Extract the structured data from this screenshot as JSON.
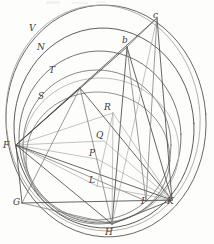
{
  "figure": {
    "width": 214,
    "height": 244,
    "background_color": "#fdfdfb",
    "ink_colors": {
      "dark": "#4a4a4a",
      "medium": "#6e6e6e",
      "light": "#9a9a9a",
      "faint": "#c2c2c2",
      "sepia": "#a9a195"
    },
    "labels": [
      {
        "id": "V",
        "text": "V",
        "x": 29,
        "y": 24
      },
      {
        "id": "N",
        "text": "N",
        "x": 37,
        "y": 43
      },
      {
        "id": "T",
        "text": "T",
        "x": 49,
        "y": 66
      },
      {
        "id": "S",
        "text": "S",
        "x": 38,
        "y": 92
      },
      {
        "id": "c",
        "text": "c",
        "x": 153,
        "y": 11
      },
      {
        "id": "b",
        "text": "b",
        "x": 122,
        "y": 36
      },
      {
        "id": "R",
        "text": "R",
        "x": 104,
        "y": 103
      },
      {
        "id": "Q",
        "text": "Q",
        "x": 96,
        "y": 131
      },
      {
        "id": "P",
        "text": "P",
        "x": 89,
        "y": 149
      },
      {
        "id": "L",
        "text": "L",
        "x": 89,
        "y": 176
      },
      {
        "id": "F",
        "text": "F",
        "x": 3,
        "y": 141
      },
      {
        "id": "G",
        "text": "G",
        "x": 13,
        "y": 198
      },
      {
        "id": "H",
        "text": "H",
        "x": 105,
        "y": 228
      },
      {
        "id": "I",
        "text": "I",
        "x": 141,
        "y": 197
      },
      {
        "id": "K",
        "text": "K",
        "x": 167,
        "y": 197
      }
    ],
    "vertices": [
      {
        "id": "c",
        "x": 157,
        "y": 18
      },
      {
        "id": "b",
        "x": 127,
        "y": 47
      },
      {
        "id": "A",
        "x": 80,
        "y": 88
      },
      {
        "id": "R",
        "x": 113,
        "y": 113
      },
      {
        "id": "Q",
        "x": 104,
        "y": 141
      },
      {
        "id": "P",
        "x": 97,
        "y": 159
      },
      {
        "id": "L",
        "x": 97,
        "y": 186
      },
      {
        "id": "F",
        "x": 16,
        "y": 145
      },
      {
        "id": "G",
        "x": 22,
        "y": 203
      },
      {
        "id": "H",
        "x": 112,
        "y": 224
      },
      {
        "id": "I",
        "x": 146,
        "y": 201
      },
      {
        "id": "K",
        "x": 172,
        "y": 200
      }
    ],
    "circles": [
      {
        "id": "outer-circle",
        "cx": 106,
        "cy": 121,
        "rx": 100,
        "ry": 116,
        "rot": -4,
        "stroke": "#5a5a5a",
        "width": 0.9
      },
      {
        "id": "outer-sepia-circle",
        "cx": 103,
        "cy": 118,
        "rx": 97,
        "ry": 113,
        "rot": -6,
        "stroke": "#a9a195",
        "width": 0.8
      },
      {
        "id": "second-circle",
        "cx": 104,
        "cy": 128,
        "rx": 90,
        "ry": 100,
        "rot": -3,
        "stroke": "#4f4f4f",
        "width": 0.9
      },
      {
        "id": "third-circle",
        "cx": 100,
        "cy": 137,
        "rx": 81,
        "ry": 86,
        "rot": -2,
        "stroke": "#5f5f5f",
        "width": 0.85
      },
      {
        "id": "inner-circle",
        "cx": 97,
        "cy": 145,
        "rx": 74,
        "ry": 75,
        "rot": 0,
        "stroke": "#6a6a6a",
        "width": 0.8
      },
      {
        "id": "lower-circle",
        "cx": 98,
        "cy": 158,
        "rx": 72,
        "ry": 66,
        "rot": 2,
        "stroke": "#787878",
        "width": 0.8
      },
      {
        "id": "faint-circle",
        "cx": 101,
        "cy": 150,
        "rx": 78,
        "ry": 72,
        "rot": 3,
        "stroke": "#b3ada4",
        "width": 0.8
      }
    ],
    "chords": [
      {
        "from": "F",
        "to": "c",
        "shade": "dark"
      },
      {
        "from": "F",
        "to": "b",
        "shade": "dark"
      },
      {
        "from": "F",
        "to": "A",
        "shade": "dark"
      },
      {
        "from": "F",
        "to": "R",
        "shade": "light"
      },
      {
        "from": "F",
        "to": "Q",
        "shade": "light"
      },
      {
        "from": "F",
        "to": "P",
        "shade": "light"
      },
      {
        "from": "F",
        "to": "L",
        "shade": "light"
      },
      {
        "from": "F",
        "to": "H",
        "shade": "dark"
      },
      {
        "from": "F",
        "to": "I",
        "shade": "medium"
      },
      {
        "from": "F",
        "to": "K",
        "shade": "dark"
      },
      {
        "from": "F",
        "to": "G",
        "shade": "dark"
      },
      {
        "from": "A",
        "to": "K",
        "shade": "dark"
      },
      {
        "from": "A",
        "to": "H",
        "shade": "medium"
      },
      {
        "from": "A",
        "to": "G",
        "shade": "medium"
      },
      {
        "from": "b",
        "to": "H",
        "shade": "dark"
      },
      {
        "from": "b",
        "to": "K",
        "shade": "dark"
      },
      {
        "from": "b",
        "to": "I",
        "shade": "medium"
      },
      {
        "from": "b",
        "to": "c",
        "shade": "medium"
      },
      {
        "from": "c",
        "to": "K",
        "shade": "dark"
      },
      {
        "from": "c",
        "to": "I",
        "shade": "medium"
      },
      {
        "from": "c",
        "to": "H",
        "shade": "light"
      },
      {
        "from": "G",
        "to": "K",
        "shade": "dark"
      },
      {
        "from": "G",
        "to": "H",
        "shade": "medium"
      },
      {
        "from": "H",
        "to": "K",
        "shade": "dark"
      },
      {
        "from": "I",
        "to": "K",
        "shade": "medium"
      },
      {
        "from": "R",
        "to": "K",
        "shade": "light"
      },
      {
        "from": "R",
        "to": "H",
        "shade": "light"
      },
      {
        "from": "Q",
        "to": "K",
        "shade": "light"
      },
      {
        "from": "P",
        "to": "K",
        "shade": "light"
      },
      {
        "from": "L",
        "to": "K",
        "shade": "light"
      },
      {
        "from": "R",
        "to": "L",
        "shade": "light"
      }
    ]
  }
}
